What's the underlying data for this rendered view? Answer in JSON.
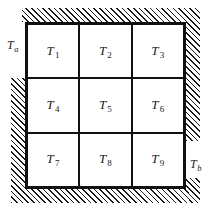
{
  "figure": {
    "colors": {
      "line": "#111111",
      "hatch": "#1a1a1a",
      "background": "#ffffff"
    }
  },
  "grid": {
    "rows": 3,
    "columns": 3,
    "cells": [
      {
        "symbol": "T",
        "subscript": "1"
      },
      {
        "symbol": "T",
        "subscript": "2"
      },
      {
        "symbol": "T",
        "subscript": "3"
      },
      {
        "symbol": "T",
        "subscript": "4"
      },
      {
        "symbol": "T",
        "subscript": "5"
      },
      {
        "symbol": "T",
        "subscript": "6"
      },
      {
        "symbol": "T",
        "subscript": "7"
      },
      {
        "symbol": "T",
        "subscript": "8"
      },
      {
        "symbol": "T",
        "subscript": "9"
      }
    ]
  },
  "boundaries": {
    "left": {
      "symbol": "T",
      "subscript": "a"
    },
    "right": {
      "symbol": "T",
      "subscript": "b"
    }
  }
}
